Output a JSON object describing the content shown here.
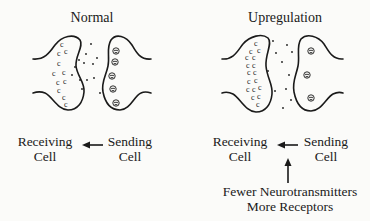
{
  "panels": [
    {
      "title": "Normal",
      "receiving_label": [
        "Receiving",
        "Cell"
      ],
      "sending_label": [
        "Sending",
        "Cell"
      ],
      "receptor_count": 11,
      "neurotransmitter_count": 5
    },
    {
      "title": "Upregulation",
      "receiving_label": [
        "Receiving",
        "Cell"
      ],
      "sending_label": [
        "Sending",
        "Cell"
      ],
      "receptor_count": 14,
      "neurotransmitter_count": 3,
      "annotation": [
        "Fewer Neurotransmitters",
        "More Receptors"
      ]
    }
  ],
  "icons": {
    "receptor": "c-shaped-receptor-icon",
    "neurotransmitter": "smiley-vesicle-icon",
    "signal_arrow": "left-arrow-icon",
    "annotation_arrow": "up-arrow-icon"
  }
}
